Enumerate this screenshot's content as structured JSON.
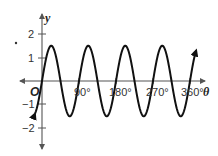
{
  "chart_data": {
    "type": "line",
    "title": "",
    "function": "y = 1.5 sin(4θ)",
    "xlabel": "θ",
    "ylabel": "y",
    "origin_label": "O",
    "x_ticks": [
      {
        "value": 90,
        "label": "90°"
      },
      {
        "value": 180,
        "label": "180°"
      },
      {
        "value": 270,
        "label": "270°"
      },
      {
        "value": 360,
        "label": "360°"
      }
    ],
    "y_ticks": [
      {
        "value": 2,
        "label": "2"
      },
      {
        "value": 1,
        "label": "1"
      },
      {
        "value": -1,
        "label": "−1"
      },
      {
        "value": -2,
        "label": "−2"
      }
    ],
    "xlim": [
      -50,
      375
    ],
    "ylim": [
      -2.8,
      2.8
    ],
    "grid": false,
    "series": [
      {
        "name": "curve",
        "amplitude": 1.5,
        "period_deg": 90,
        "x": [
          -17,
          0,
          22.5,
          45,
          67.5,
          90,
          112.5,
          135,
          157.5,
          180,
          202.5,
          225,
          247.5,
          270,
          292.5,
          315,
          337.5,
          360,
          375
        ],
        "y": [
          -1.5,
          0,
          1.5,
          0,
          -1.5,
          0,
          1.5,
          0,
          -1.5,
          0,
          1.5,
          0,
          -1.5,
          0,
          1.5,
          0,
          -1.5,
          0,
          1.5
        ]
      }
    ],
    "colors": {
      "curve": "#111111",
      "axes": "#555555"
    }
  }
}
